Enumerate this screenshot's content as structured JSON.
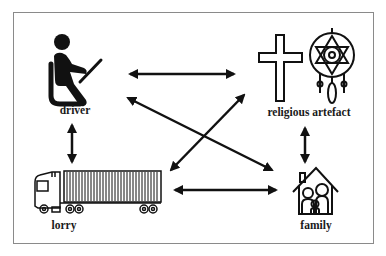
{
  "diagram": {
    "nodes": [
      {
        "id": "driver",
        "label": "driver",
        "icon": "seated-driver-icon"
      },
      {
        "id": "religious_artefact",
        "label": "religious artefact",
        "icon": "cross-and-dreamcatcher-icon"
      },
      {
        "id": "lorry",
        "label": "lorry",
        "icon": "container-truck-icon"
      },
      {
        "id": "family",
        "label": "family",
        "icon": "family-house-icon"
      }
    ],
    "edges": [
      {
        "from": "driver",
        "to": "religious_artefact",
        "type": "bidirectional"
      },
      {
        "from": "driver",
        "to": "lorry",
        "type": "bidirectional"
      },
      {
        "from": "driver",
        "to": "family",
        "type": "bidirectional"
      },
      {
        "from": "lorry",
        "to": "religious_artefact",
        "type": "bidirectional"
      },
      {
        "from": "lorry",
        "to": "family",
        "type": "bidirectional"
      },
      {
        "from": "religious_artefact",
        "to": "family",
        "type": "bidirectional"
      }
    ]
  }
}
